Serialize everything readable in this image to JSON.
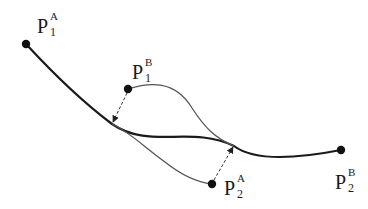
{
  "diagram": {
    "title": "",
    "colors": {
      "curve_a": "#1a1a1a",
      "curve_b": "#555555",
      "point": "#111111",
      "arrow": "#333333",
      "background": "#ffffff"
    },
    "points": [
      {
        "id": "p1a",
        "base": "P",
        "subscript": "1",
        "superscript": "A"
      },
      {
        "id": "p1b",
        "base": "P",
        "subscript": "1",
        "superscript": "B"
      },
      {
        "id": "p2a",
        "base": "P",
        "subscript": "2",
        "superscript": "A"
      },
      {
        "id": "p2b",
        "base": "P",
        "subscript": "2",
        "superscript": "B"
      }
    ],
    "curves": [
      {
        "id": "curve-a",
        "from": "P1A",
        "to": "P2B",
        "style": "solid-thick"
      },
      {
        "id": "curve-b",
        "from": "P1B",
        "to": "P2A",
        "style": "solid-thin-gray"
      }
    ],
    "arrows": [
      {
        "id": "arrow-p1b",
        "from": "P1B",
        "to": "curve A",
        "style": "dashed"
      },
      {
        "id": "arrow-p2a",
        "from": "P2A",
        "to": "curve A",
        "style": "dashed"
      }
    ]
  }
}
